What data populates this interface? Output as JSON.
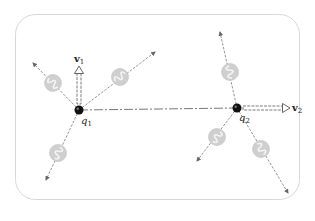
{
  "diagram": {
    "title": "",
    "colors": {
      "frame": "#d8d8d8",
      "ray": "#777777",
      "arrowhead": "#666666",
      "photon_fill": "#cfcfcf",
      "photon_wave": "#f4f4f4",
      "charge": "#111111",
      "link_line": "#555555",
      "velocity_arrow": "#444444",
      "label": "#222222"
    },
    "charges": [
      {
        "id": "q1",
        "label": "q",
        "subscript": "1",
        "x": 79,
        "y": 110,
        "velocity": {
          "label": "v",
          "subscript": "1",
          "direction": "up",
          "tip_x": 79,
          "tip_y": 66
        },
        "rays": [
          {
            "end_x": 33,
            "end_y": 63,
            "photon_x": 53,
            "photon_y": 83
          },
          {
            "end_x": 155,
            "end_y": 52,
            "photon_x": 120,
            "photon_y": 77
          },
          {
            "end_x": 46,
            "end_y": 180,
            "photon_x": 58,
            "photon_y": 153
          }
        ]
      },
      {
        "id": "q2",
        "label": "q",
        "subscript": "2",
        "x": 237,
        "y": 108,
        "velocity": {
          "label": "v",
          "subscript": "2",
          "direction": "right",
          "tip_x": 290,
          "tip_y": 108
        },
        "rays": [
          {
            "end_x": 220,
            "end_y": 32,
            "photon_x": 230,
            "photon_y": 72
          },
          {
            "end_x": 197,
            "end_y": 161,
            "photon_x": 217,
            "photon_y": 137
          },
          {
            "end_x": 288,
            "end_y": 193,
            "photon_x": 261,
            "photon_y": 149
          }
        ]
      }
    ],
    "link": {
      "from": "q1",
      "to": "q2",
      "style": "dash-dot"
    }
  }
}
